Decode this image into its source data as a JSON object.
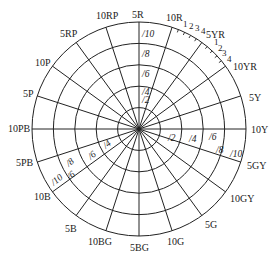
{
  "diagram": {
    "center": [
      139,
      129
    ],
    "rings": [
      {
        "chroma": "/2",
        "radius": 21.4
      },
      {
        "chroma": "/4",
        "radius": 42.8
      },
      {
        "chroma": "/6",
        "radius": 64.2
      },
      {
        "chroma": "/8",
        "radius": 85.6
      },
      {
        "chroma": "/10",
        "radius": 107
      }
    ],
    "hues": [
      {
        "label": "5R",
        "angle": 0
      },
      {
        "label": "10R",
        "angle": 18
      },
      {
        "label": "5YR",
        "angle": 36
      },
      {
        "label": "10YR",
        "angle": 54
      },
      {
        "label": "5Y",
        "angle": 72
      },
      {
        "label": "10Y",
        "angle": 90
      },
      {
        "label": "5GY",
        "angle": 108
      },
      {
        "label": "10GY",
        "angle": 126
      },
      {
        "label": "5G",
        "angle": 144
      },
      {
        "label": "10G",
        "angle": 162
      },
      {
        "label": "5BG",
        "angle": 180
      },
      {
        "label": "10BG",
        "angle": 198
      },
      {
        "label": "5B",
        "angle": 216
      },
      {
        "label": "10B",
        "angle": 234
      },
      {
        "label": "5PB",
        "angle": 252
      },
      {
        "label": "10PB",
        "angle": 270
      },
      {
        "label": "5P",
        "angle": 288
      },
      {
        "label": "10P",
        "angle": 306
      },
      {
        "label": "5RP",
        "angle": 324
      },
      {
        "label": "10RP",
        "angle": 342
      }
    ],
    "ticks_10R_5YR": [
      "1",
      "2",
      "3",
      "4"
    ],
    "ticks_5YR_10YR": [
      "1",
      "2",
      "3",
      "4"
    ],
    "chroma_labels_top": [
      "/10",
      "/8",
      "/6",
      "/4",
      "/2"
    ],
    "chroma_labels_right": [
      "/2",
      "/4",
      "/6",
      "/8",
      "/10"
    ],
    "chroma_labels_left": [
      "/4",
      "/6",
      "/8",
      "/6",
      "/10"
    ],
    "line_color": "#222222",
    "background": "#ffffff"
  }
}
